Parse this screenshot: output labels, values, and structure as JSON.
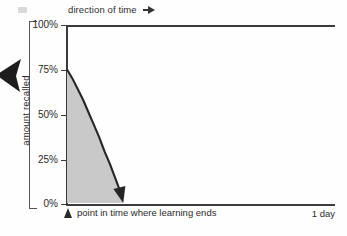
{
  "figure": {
    "header_label": "direction of time",
    "header_arrow_icon": "triangle-right-icon",
    "left_pointer_icon": "arrow-left-solid-icon",
    "corner_artifact_icon": "scan-artifact-icon",
    "y_axis_title": "amount recalled",
    "x_origin_marker_icon": "triangle-up-icon",
    "x_origin_label": "point in time where learning ends",
    "x_end_label": "1 day",
    "colors": {
      "line": "#3b3b3b",
      "fill": "#c9c9c9",
      "text": "#2b2b2b",
      "background": "#fefefe"
    }
  },
  "chart_data": {
    "type": "area",
    "title": "",
    "subtitle": "",
    "xlabel": "direction of time",
    "ylabel": "amount recalled",
    "xlim": [
      0,
      1
    ],
    "ylim": [
      0,
      100
    ],
    "grid": false,
    "legend": "none",
    "ytick_labels": [
      "100%",
      "75%",
      "50%",
      "25%",
      "0%"
    ],
    "ytick_values": [
      100,
      75,
      50,
      25,
      0
    ],
    "xtick_labels": [
      "point in time where learning ends",
      "1 day"
    ],
    "xtick_values": [
      0,
      1
    ],
    "series": [
      {
        "name": "forgetting curve",
        "x": [
          0.0,
          0.02,
          0.04,
          0.06,
          0.08,
          0.1,
          0.12,
          0.14,
          0.16,
          0.18,
          0.2,
          0.21
        ],
        "values": [
          75,
          70,
          64,
          58,
          51,
          44,
          37,
          29,
          22,
          14,
          6,
          0
        ]
      }
    ],
    "annotations": [
      {
        "text": "direction of time",
        "position": "top-left-above-axis"
      },
      {
        "text": "point in time where learning ends",
        "position": "below-x-origin"
      },
      {
        "text": "1 day",
        "position": "below-x-right-end"
      }
    ]
  }
}
